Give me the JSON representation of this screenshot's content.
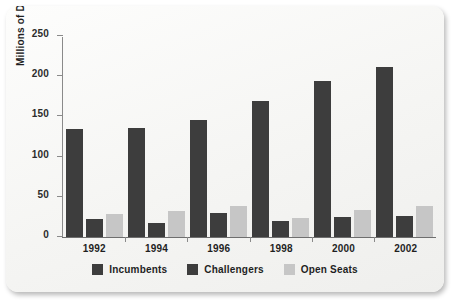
{
  "chart_data": {
    "type": "bar",
    "title": "",
    "xlabel": "",
    "ylabel": "Millions of Dollars",
    "categories": [
      "1992",
      "1994",
      "1996",
      "1998",
      "2000",
      "2002"
    ],
    "series": [
      {
        "name": "Incumbents",
        "color": "#3d3d3d",
        "values": [
          134,
          136,
          146,
          169,
          194,
          212
        ]
      },
      {
        "name": "Challengers",
        "color": "#3d3d3d",
        "values": [
          22,
          17,
          30,
          20,
          25,
          26
        ]
      },
      {
        "name": "Open Seats",
        "color": "#c6c6c6",
        "values": [
          29,
          32,
          38,
          24,
          34,
          38
        ]
      }
    ],
    "ylim": [
      0,
      250
    ],
    "yticks": [
      0,
      50,
      100,
      150,
      200,
      250
    ],
    "ytick_labels": [
      "0",
      "50",
      "100",
      "150",
      "200",
      "250"
    ],
    "grid": false,
    "legend_position": "bottom"
  },
  "legend": {
    "items": [
      {
        "label": "Incumbents",
        "color": "#3d3d3d"
      },
      {
        "label": "Challengers",
        "color": "#3d3d3d"
      },
      {
        "label": "Open Seats",
        "color": "#c6c6c6"
      }
    ]
  }
}
